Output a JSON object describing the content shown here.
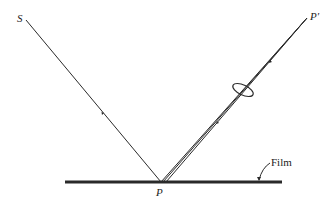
{
  "diagram": {
    "labels": {
      "source": "S",
      "image_point": "P′",
      "point": "P",
      "film": "Film"
    },
    "colors": {
      "line": "#2a2a2a",
      "background": "#ffffff"
    }
  }
}
